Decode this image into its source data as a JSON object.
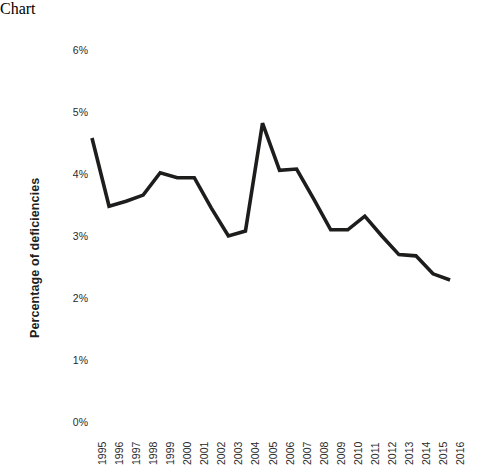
{
  "chart_data": {
    "type": "line",
    "title": "",
    "xlabel": "",
    "ylabel": "Percentage of deficiencies",
    "categories": [
      "1995",
      "1996",
      "1997",
      "1998",
      "1999",
      "2000",
      "2001",
      "2002",
      "2003",
      "2004",
      "2005",
      "2006",
      "2007",
      "2008",
      "2009",
      "2010",
      "2011",
      "2012",
      "2013",
      "2014",
      "2015",
      "2016"
    ],
    "values": [
      4.58,
      3.48,
      3.56,
      3.66,
      4.02,
      3.94,
      3.94,
      3.45,
      3.0,
      3.08,
      4.82,
      4.06,
      4.08,
      3.6,
      3.1,
      3.1,
      3.32,
      3.0,
      2.7,
      2.68,
      2.39,
      2.29
    ],
    "series": [
      {
        "name": "Percentage of deficiencies",
        "values": [
          4.58,
          3.48,
          3.56,
          3.66,
          4.02,
          3.94,
          3.94,
          3.45,
          3.0,
          3.08,
          4.82,
          4.06,
          4.08,
          3.6,
          3.1,
          3.1,
          3.32,
          3.0,
          2.7,
          2.68,
          2.39,
          2.29
        ]
      }
    ],
    "ylim": [
      0,
      6
    ],
    "ytick_labels": [
      "6%",
      "5%",
      "4%",
      "3%",
      "2%",
      "1%",
      "0%"
    ],
    "ytick_values": [
      6,
      5,
      4,
      3,
      2,
      1,
      0
    ],
    "grid": false,
    "legend": false,
    "legend_position": "none",
    "line_color": "#1d1d1b",
    "background_color": "#ffffff",
    "axis_label_color": "#2b2b2b"
  }
}
